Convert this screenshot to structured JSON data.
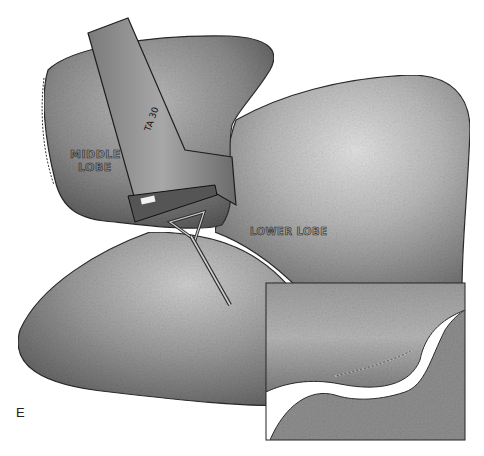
{
  "figure": {
    "panel_letter": "E",
    "labels": {
      "middle_lobe_line1": "MIDDLE",
      "middle_lobe_line2": "LOBE",
      "lower_lobe": "LOWER LOBE",
      "stapler": "TA 30"
    },
    "inset": {
      "description": "Close-up of stapled fissure between lobes"
    },
    "colors": {
      "lobe_dark": "#6e6e6e",
      "lobe_mid": "#9a9a9a",
      "lobe_light": "#d8d8d8",
      "outline": "#2b2b2b",
      "background": "#ffffff"
    }
  }
}
